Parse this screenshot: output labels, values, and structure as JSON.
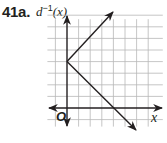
{
  "problem": {
    "label": "41a."
  },
  "chart_data": {
    "type": "line",
    "title": "",
    "xlabel": "x",
    "ylabel": "d⁻¹(x)",
    "origin_label": "O",
    "grid": true,
    "xlim": [
      -1,
      8
    ],
    "ylim": [
      -2,
      8
    ],
    "tick_labels": [],
    "series": [
      {
        "name": "upper branch",
        "points": [
          [
            0,
            4
          ],
          [
            4,
            8
          ]
        ],
        "arrow_end": true,
        "equation": "y = 4 + x"
      },
      {
        "name": "lower branch",
        "points": [
          [
            0,
            4
          ],
          [
            6,
            -2
          ]
        ],
        "arrow_end": true,
        "equation": "y = 4 - x"
      }
    ],
    "vertex": [
      0,
      4
    ],
    "x_intercept": [
      4,
      0
    ],
    "y_intercept": [
      0,
      4
    ]
  },
  "colors": {
    "ink": "#231f20",
    "grid": "#b8b8b8"
  }
}
